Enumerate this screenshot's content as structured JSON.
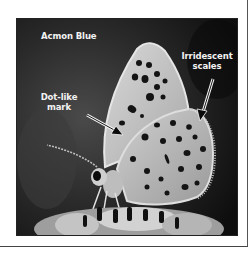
{
  "figure": {
    "title": "Acmon Blue",
    "annotations": [
      {
        "id": "dot-like-mark",
        "text_line1": "Dot-like",
        "text_line2": "mark",
        "arrow_direction": "down-right"
      },
      {
        "id": "irridescent-scales",
        "text_line1": "Irridescent",
        "text_line2": "scales",
        "arrow_direction": "down-left"
      }
    ],
    "image_description": "Grayscale macro photograph of an Acmon Blue butterfly perched on a flower head, wings closed, spotted underside visible",
    "colors": {
      "background": "#1a1a1a",
      "wing": "#c8c8c8",
      "spots": "#141414",
      "label_text": "#f2f2f2",
      "page": "#ffffff"
    }
  }
}
